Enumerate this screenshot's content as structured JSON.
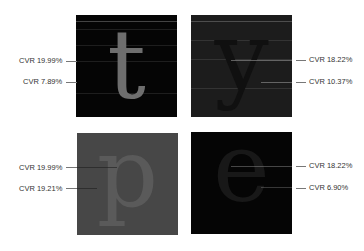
{
  "panels": [
    {
      "id": "top-left",
      "letter": "t",
      "background": "#050505",
      "glyph_color": "#6e6e6e",
      "labels": [
        {
          "text": "CVR 19.99%",
          "side": "left"
        },
        {
          "text": "CVR 7.89%",
          "side": "left"
        }
      ]
    },
    {
      "id": "top-right",
      "letter": "y",
      "background": "#1c1c1c",
      "glyph_color": "#111111",
      "labels": [
        {
          "text": "CVR 18.22%",
          "side": "right"
        },
        {
          "text": "CVR 10.37%",
          "side": "right"
        }
      ]
    },
    {
      "id": "bottom-left",
      "letter": "p",
      "background": "#474747",
      "glyph_color": "#5a5a5a",
      "labels": [
        {
          "text": "CVR 19.99%",
          "side": "left"
        },
        {
          "text": "CVR 19.21%",
          "side": "left"
        }
      ]
    },
    {
      "id": "bottom-right",
      "letter": "e",
      "background": "#050505",
      "glyph_color": "#141414",
      "labels": [
        {
          "text": "CVR 18.22%",
          "side": "right"
        },
        {
          "text": "CVR 6.90%",
          "side": "right"
        }
      ]
    }
  ]
}
